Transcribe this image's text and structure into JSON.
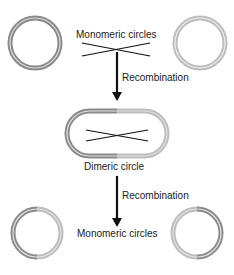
{
  "labels": {
    "top": "Monomeric circles",
    "recomb1": "Recombination",
    "dimer": "Dimeric circle",
    "recomb2": "Recombination",
    "bottom": "Monomeric circles"
  },
  "colors": {
    "dark_ring": "#8a8a8a",
    "light_ring": "#bdbdbd",
    "ring_inner": "#e6e6e6",
    "line": "#111111"
  }
}
